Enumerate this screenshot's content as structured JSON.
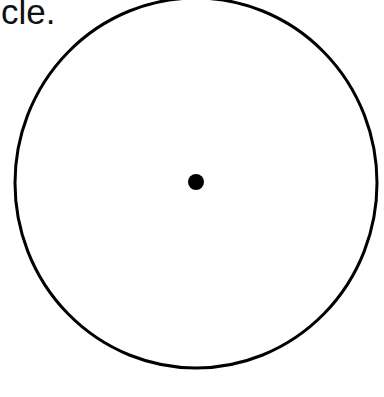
{
  "caption": {
    "text": "cle."
  },
  "figure": {
    "shape": "circle",
    "center_point": {
      "cx": 196,
      "cy": 182,
      "r": 8
    },
    "outline": {
      "cx": 196,
      "cy": 183,
      "rx": 181,
      "ry": 185,
      "stroke_width": 3
    },
    "colors": {
      "stroke": "#000000",
      "fill": "#ffffff",
      "dot": "#000000"
    }
  }
}
